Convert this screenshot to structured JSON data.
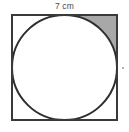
{
  "figure": {
    "dimension_label": "7 cm",
    "canvas": {
      "width": 129,
      "height": 132,
      "background": "#ffffff"
    },
    "square": {
      "label": "square-outline",
      "x": 12,
      "y": 15,
      "side_px": 105,
      "side_value": 7,
      "units": "cm",
      "stroke": "#3a3a3a",
      "stroke_width": 2,
      "fill": "#ffffff"
    },
    "circle": {
      "label": "inscribed-circle",
      "cx": 64.5,
      "cy": 67.5,
      "r": 52.5,
      "diameter_value": 7,
      "units": "cm",
      "stroke": "#2e2e2e",
      "stroke_width": 2,
      "fill": "#ffffff"
    },
    "shaded_region": {
      "label": "top-right-corner-segment",
      "description": "Region between the square's top-right corner and the circle arc",
      "fill": "#a8a8a8",
      "corner": "top-right"
    },
    "stray_mark": {
      "label": "stray-dot",
      "x": 122,
      "y": 67,
      "color": "#9a9a9a"
    }
  }
}
